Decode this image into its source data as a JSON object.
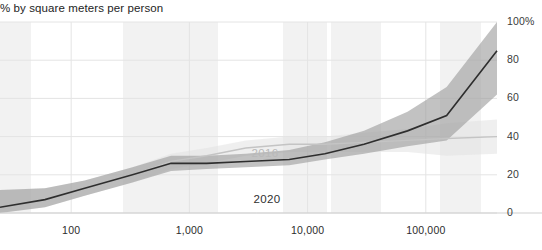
{
  "chart_data": {
    "type": "line",
    "title": "% by square meters per person",
    "xlabel": "",
    "ylabel": "",
    "xscale": "log",
    "xlim": [
      25,
      400000
    ],
    "ylim": [
      0,
      100
    ],
    "grid": true,
    "legend": "inline-labels",
    "ytick_labels": [
      "100%",
      "80",
      "60",
      "40",
      "20",
      "0"
    ],
    "ytick_values": [
      100,
      80,
      60,
      40,
      20,
      0
    ],
    "xtick_labels": [
      "100",
      "1,000",
      "10,000",
      "100,000"
    ],
    "xtick_values": [
      100,
      1000,
      10000,
      100000
    ],
    "series": [
      {
        "name": "2020",
        "color": "#2e2e2e",
        "band_color": "#9a9a9a",
        "x": [
          25,
          60,
          130,
          330,
          700,
          1400,
          3000,
          7000,
          14000,
          30000,
          70000,
          150000,
          400000
        ],
        "values": [
          3,
          7,
          13,
          20,
          26,
          26,
          27,
          28,
          31,
          36,
          43,
          51,
          85
        ],
        "band_low": [
          0,
          3,
          9,
          16,
          22,
          23,
          24,
          25,
          28,
          31,
          35,
          38,
          62
        ],
        "band_high": [
          12,
          13,
          17,
          24,
          30,
          30,
          31,
          33,
          37,
          43,
          53,
          66,
          100
        ]
      },
      {
        "name": "2016",
        "color": "#c4c4c4",
        "band_color": "#e2e2e2",
        "x": [
          25,
          60,
          130,
          330,
          700,
          1400,
          3000,
          7000,
          14000,
          30000,
          70000,
          150000,
          400000
        ],
        "values": [
          3,
          7,
          13,
          20,
          27,
          30,
          34,
          36,
          36,
          37,
          38,
          39,
          40
        ],
        "band_low": [
          0,
          3,
          9,
          16,
          23,
          26,
          30,
          32,
          32,
          32,
          32,
          30,
          31
        ],
        "band_high": [
          12,
          13,
          17,
          24,
          31,
          34,
          38,
          40,
          40,
          42,
          44,
          47,
          49
        ]
      }
    ],
    "annotations": [
      {
        "text": "2016",
        "x_px": 265,
        "y_px": 147,
        "series": "2016"
      },
      {
        "text": "2020",
        "x_px": 267,
        "y_px": 193,
        "series": "2020"
      }
    ],
    "density_bands": [
      {
        "x_start_px": 0,
        "x_end_px": 31
      },
      {
        "x_start_px": 123,
        "x_end_px": 218
      },
      {
        "x_start_px": 283,
        "x_end_px": 327
      },
      {
        "x_start_px": 331,
        "x_end_px": 381
      },
      {
        "x_start_px": 440,
        "x_end_px": 481
      }
    ],
    "colors": {
      "line_2020": "#2e2e2e",
      "line_2016": "#c4c4c4",
      "band_2020": "#9a9a9a",
      "band_2016": "#e2e2e2",
      "grid": "#e4e4e4",
      "density_band": "#f2f2f2",
      "background": "#ffffff"
    }
  }
}
